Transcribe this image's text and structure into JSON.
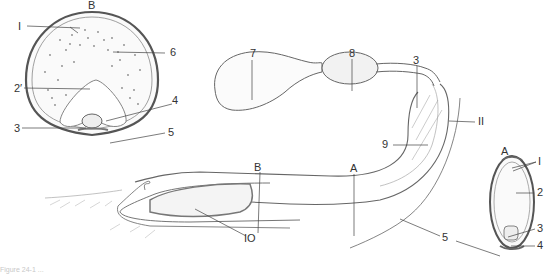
{
  "figure": {
    "caption_partial": "Figure 24-1 ...",
    "colors": {
      "ink": "#555555",
      "light_ink": "#999999",
      "background": "#ffffff"
    },
    "cross_section_B": {
      "title": "B",
      "labels": [
        {
          "id": "1",
          "text": "I"
        },
        {
          "id": "6",
          "text": "6"
        },
        {
          "id": "2prime",
          "text": "2′"
        },
        {
          "id": "4",
          "text": "4"
        },
        {
          "id": "3",
          "text": "3"
        },
        {
          "id": "5",
          "text": "5"
        }
      ]
    },
    "longitudinal": {
      "labels": [
        {
          "id": "7",
          "text": "7"
        },
        {
          "id": "8",
          "text": "8"
        },
        {
          "id": "3",
          "text": "3"
        },
        {
          "id": "11",
          "text": "II"
        },
        {
          "id": "9",
          "text": "9"
        },
        {
          "id": "A",
          "text": "A"
        },
        {
          "id": "B",
          "text": "B"
        },
        {
          "id": "10",
          "text": "IO"
        },
        {
          "id": "5",
          "text": "5"
        }
      ]
    },
    "cross_section_A": {
      "title": "A",
      "labels": [
        {
          "id": "1",
          "text": "I"
        },
        {
          "id": "2",
          "text": "2"
        },
        {
          "id": "3",
          "text": "3"
        },
        {
          "id": "4",
          "text": "4"
        }
      ]
    }
  }
}
